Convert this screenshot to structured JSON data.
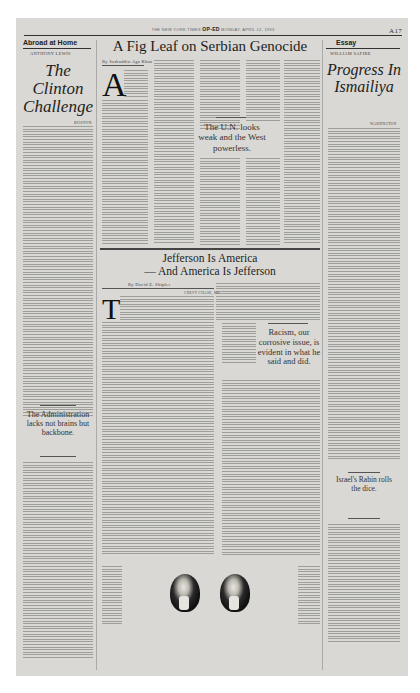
{
  "masthead": {
    "left": "THE NEW YORK TIMES",
    "section": "OP-ED",
    "date": "MONDAY, APRIL 12, 1993",
    "page_number": "A17"
  },
  "left_column": {
    "kicker": "Abroad at Home",
    "author": "ANTHONY LEWIS",
    "headline": "The Clinton Challenge",
    "dateline": "BOSTON",
    "pull_quote": "The Administration lacks not brains but backbone."
  },
  "center_top": {
    "headline": "A Fig Leaf on Serbian Genocide",
    "byline": "By Sadruddin Aga Khan",
    "dropcap": "A",
    "pull_quote": "The U.N. looks weak and the West powerless."
  },
  "right_column": {
    "kicker": "Essay",
    "author": "WILLIAM SAFIRE",
    "headline": "Progress In Ismailiya",
    "dateline": "WASHINGTON",
    "pull_quote": "Israel's Rabin rolls the dice."
  },
  "center_bottom": {
    "headline_line1": "Jefferson Is America",
    "headline_line2": "— And America Is Jefferson",
    "byline": "By David E. Shipler",
    "dateline": "CHEVY CHASE, Md.",
    "dropcap": "T",
    "pull_quote": "Racism, our corrosive issue, is evident in what he said and did.",
    "illustration": "two portraits of Thomas Jefferson"
  }
}
